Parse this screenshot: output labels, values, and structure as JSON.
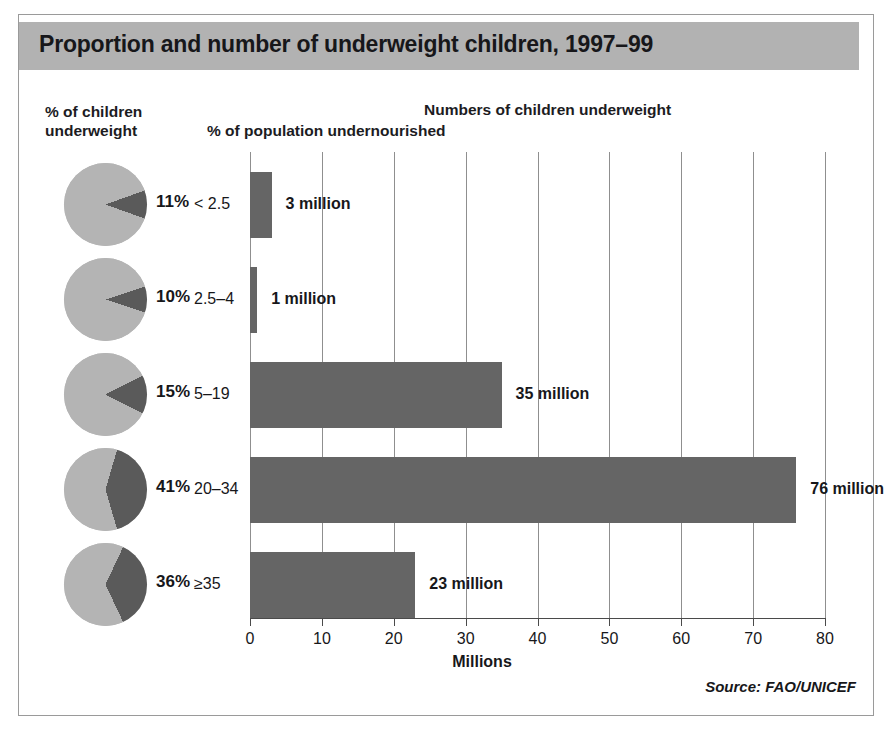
{
  "title": "Proportion and number of underweight children, 1997–99",
  "headings": {
    "pie_line1": "% of children",
    "pie_line2": "underweight",
    "bars": "Numbers of children underweight",
    "subheading": "% of population undernourished"
  },
  "source": "Source: FAO/UNICEF",
  "colors": {
    "banner": "#b2b2b2",
    "bar": "#656565",
    "pie_light": "#b4b4b4",
    "pie_dark": "#5a5a5a",
    "grid": "#8f8f8f",
    "text": "#17171a"
  },
  "chart_data": {
    "type": "bar",
    "title": "Proportion and number of underweight children, 1997–99",
    "subtitle": "Numbers of children underweight",
    "xlabel": "Millions",
    "ylabel": "% of population undernourished",
    "orientation": "horizontal",
    "xlim": [
      0,
      80
    ],
    "xticks": [
      0,
      10,
      20,
      30,
      40,
      50,
      60,
      70,
      80
    ],
    "xtick_labels": [
      "0",
      "10",
      "20",
      "30",
      "40",
      "50",
      "60",
      "70",
      "80"
    ],
    "grid": "vertical",
    "legend": "none",
    "categories": [
      "< 2.5",
      "2.5–4",
      "5–19",
      "20–34",
      "≥35"
    ],
    "values": [
      3,
      1,
      35,
      76,
      23
    ],
    "value_labels": [
      "3 million",
      "1 million",
      "35 million",
      "76 million",
      "23 million"
    ],
    "secondary_series": {
      "name": "% of children underweight",
      "type": "pie",
      "unit": "%",
      "values": [
        11,
        10,
        15,
        41,
        36
      ],
      "labels": [
        "11%",
        "10%",
        "15%",
        "41%",
        "36%"
      ]
    }
  }
}
